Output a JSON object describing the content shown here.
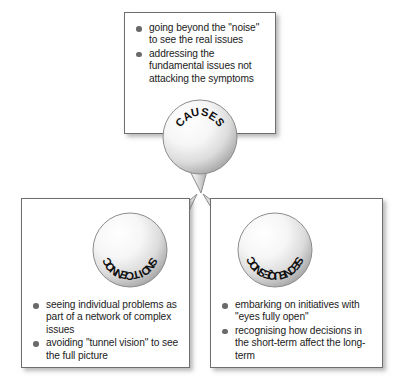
{
  "diagram": {
    "type": "three-node-balloon-diagram",
    "background_color": "#ffffff",
    "box_border_color": "#6e6e6e",
    "bullet_color": "#6a6a6a",
    "balloon_fill_light": "#ffffff",
    "balloon_fill_shade": "#b9b9b9",
    "balloon_outline": "#8c8c8c",
    "text_color": "#1b1b1b"
  },
  "nodes": [
    {
      "id": "causes",
      "label": "CAUSES",
      "position": "top",
      "bullets": [
        "going beyond the \"noise\" to see the real issues",
        "addressing the fundamental issues not attacking the symptoms"
      ]
    },
    {
      "id": "connections",
      "label": "CONNECTIONS",
      "position": "bottom-left",
      "bullets": [
        "seeing individual problems as part of a network of complex issues",
        "avoiding \"tunnel vision\" to see the full picture"
      ]
    },
    {
      "id": "consequences",
      "label": "CONSEQUENCES",
      "position": "bottom-right",
      "bullets": [
        "embarking on initiatives with \"eyes fully open\"",
        "recognising how decisions in the short-term affect the long-term"
      ]
    }
  ]
}
